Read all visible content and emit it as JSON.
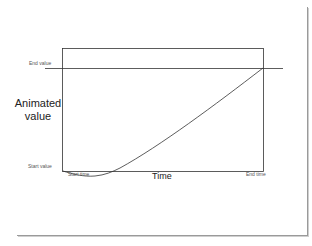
{
  "diagram": {
    "y_axis_label_line1": "Animated",
    "y_axis_label_line2": "value",
    "x_axis_label": "Time",
    "end_value_label": "End value",
    "start_value_label": "Start value",
    "start_time_label": "Start time",
    "end_time_label": "End time",
    "colors": {
      "line": "#333333",
      "frame_border": "#9a9a9a",
      "background": "#ffffff"
    },
    "curve_description": "Ease-in-back style curve: dips slightly below start value after start time, then rises roughly linearly to end value at end time"
  }
}
